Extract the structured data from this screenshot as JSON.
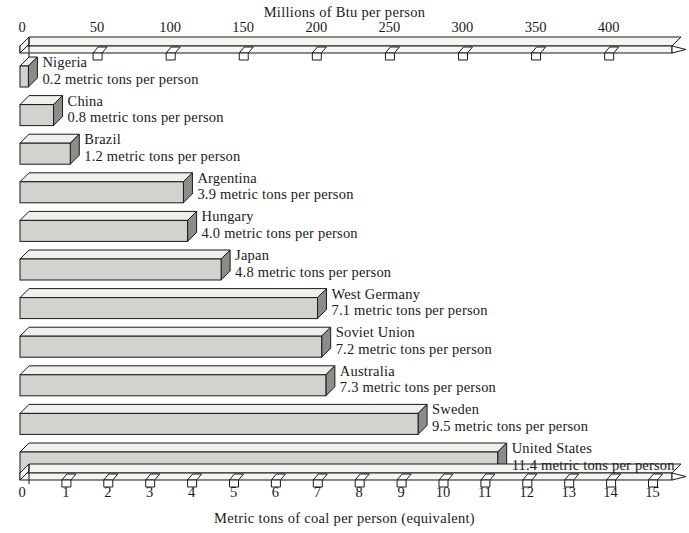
{
  "chart_data": {
    "type": "bar",
    "orientation": "horizontal",
    "title": "",
    "xlabel": "Metric tons of coal per person (equivalent)",
    "ylabel": "",
    "secondary_xlabel": "Millions of Btu per person",
    "xlim": [
      0,
      15
    ],
    "secondary_xlim": [
      0,
      430
    ],
    "grid": false,
    "legend": null,
    "value_unit": "metric tons per person",
    "categories": [
      "Nigeria",
      "China",
      "Brazil",
      "Argentina",
      "Hungary",
      "Japan",
      "West Germany",
      "Soviet Union",
      "Australia",
      "Sweden",
      "United States"
    ],
    "values": [
      0.2,
      0.8,
      1.2,
      3.9,
      4.0,
      4.8,
      7.1,
      7.2,
      7.3,
      9.5,
      11.4
    ],
    "value_labels": [
      "0.2 metric tons per person",
      "0.8 metric tons per person",
      "1.2 metric tons per person",
      "3.9 metric tons per person",
      "4.0 metric tons per person",
      "4.8 metric tons per person",
      "7.1 metric tons per person",
      "7.2 metric tons per person",
      "7.3 metric tons per person",
      "9.5 metric tons per person",
      "11.4 metric tons per person"
    ],
    "bottom_axis_ticks": [
      "0",
      "1",
      "2",
      "3",
      "4",
      "5",
      "6",
      "7",
      "8",
      "9",
      "10",
      "11",
      "12",
      "13",
      "14",
      "15"
    ],
    "bottom_axis_tick_values": [
      0,
      1,
      2,
      3,
      4,
      5,
      6,
      7,
      8,
      9,
      10,
      11,
      12,
      13,
      14,
      15
    ],
    "top_axis_ticks": [
      "0",
      "50",
      "100",
      "150",
      "200",
      "250",
      "300",
      "350",
      "400"
    ],
    "top_axis_tick_values": [
      0,
      50,
      100,
      150,
      200,
      250,
      300,
      350,
      400
    ],
    "colors": {
      "background": "#ffffff",
      "bar_face": "#d2d2cf",
      "bar_side": "#8c8c89",
      "bar_top": "#efefec",
      "outline": "#1a1a1a",
      "axis_band": "#f4f4f1",
      "text": "#1a1a1a"
    }
  },
  "axes": {
    "top": {
      "title": "Millions of Btu per person",
      "ticks": [
        "0",
        "50",
        "100",
        "150",
        "200",
        "250",
        "300",
        "350",
        "400"
      ]
    },
    "bottom": {
      "title": "Metric tons of coal per person (equivalent)",
      "ticks": [
        "0",
        "1",
        "2",
        "3",
        "4",
        "5",
        "6",
        "7",
        "8",
        "9",
        "10",
        "11",
        "12",
        "13",
        "14",
        "15"
      ]
    }
  }
}
